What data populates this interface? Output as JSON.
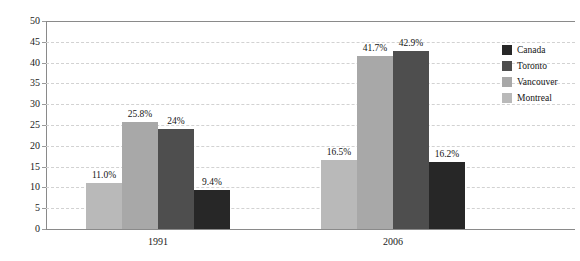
{
  "chart_data": {
    "type": "bar",
    "title": "",
    "subtitle": "",
    "xlabel": "",
    "ylabel": "",
    "categories": [
      "1991",
      "2006"
    ],
    "ylim": [
      0,
      50
    ],
    "yticks": [
      0,
      5,
      10,
      15,
      20,
      25,
      30,
      35,
      40,
      45,
      50
    ],
    "grid": true,
    "legend_position": "right",
    "series": [
      {
        "name": "Canada",
        "color": "#272727",
        "values": [
          9.4,
          16.2
        ],
        "labels": [
          "9.4%",
          "16.2%"
        ]
      },
      {
        "name": "Toronto",
        "color": "#4e4e4e",
        "values": [
          24.0,
          42.9
        ],
        "labels": [
          "24%",
          "42.9%"
        ]
      },
      {
        "name": "Vancouver",
        "color": "#a8a8a8",
        "values": [
          25.8,
          41.7
        ],
        "labels": [
          "25.8%",
          "41.7%"
        ]
      },
      {
        "name": "Montreal",
        "color": "#b9b9b9",
        "values": [
          11.0,
          16.5
        ],
        "labels": [
          "11.0%",
          "16.5%"
        ]
      }
    ],
    "bar_draw_order": [
      "Montreal",
      "Vancouver",
      "Toronto",
      "Canada"
    ]
  },
  "legend": {
    "items": [
      {
        "label": "Canada",
        "color": "#272727"
      },
      {
        "label": "Toronto",
        "color": "#4e4e4e"
      },
      {
        "label": "Vancouver",
        "color": "#a8a8a8"
      },
      {
        "label": "Montreal",
        "color": "#b9b9b9"
      }
    ]
  },
  "axis": {
    "y_tick_labels": [
      "50",
      "45",
      "40",
      "35",
      "30",
      "25",
      "20",
      "15",
      "10",
      "5",
      "0"
    ],
    "x_tick_labels": [
      "1991",
      "2006"
    ]
  }
}
